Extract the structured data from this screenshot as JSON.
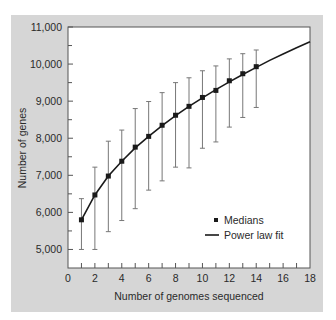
{
  "chart_data": {
    "type": "scatter",
    "title": "",
    "xlabel": "Number of genomes sequenced",
    "ylabel": "Number of genes",
    "xlim": [
      0,
      18
    ],
    "ylim": [
      4500,
      11000
    ],
    "xticks": [
      0,
      2,
      4,
      6,
      8,
      10,
      12,
      14,
      16,
      18
    ],
    "yticks": [
      5000,
      6000,
      7000,
      8000,
      9000,
      10000,
      11000
    ],
    "ytick_labels": [
      "5,000",
      "6,000",
      "7,000",
      "8,000",
      "9,000",
      "10,000",
      "11,000"
    ],
    "grid": false,
    "legend_position": "lower right",
    "series": [
      {
        "name": "Medians",
        "style": "square markers with error bars",
        "x": [
          1,
          2,
          3,
          4,
          5,
          6,
          7,
          8,
          9,
          10,
          11,
          12,
          13,
          14
        ],
        "values": [
          5800,
          6470,
          6980,
          7380,
          7760,
          8050,
          8350,
          8620,
          8860,
          9100,
          9290,
          9550,
          9740,
          9930
        ],
        "error_high": [
          6370,
          7220,
          7920,
          8220,
          8800,
          8990,
          9230,
          9500,
          9630,
          9820,
          9950,
          10140,
          10280,
          10380
        ],
        "error_low": [
          5000,
          5000,
          5480,
          5780,
          6100,
          6600,
          6850,
          7220,
          7200,
          7730,
          7900,
          8300,
          8560,
          8830
        ]
      },
      {
        "name": "Power law fit",
        "style": "solid line",
        "x": [
          1,
          2,
          3,
          4,
          5,
          6,
          7,
          8,
          9,
          10,
          11,
          12,
          13,
          14,
          15,
          16,
          17,
          18
        ],
        "values": [
          5800,
          6470,
          6980,
          7380,
          7740,
          8050,
          8340,
          8610,
          8860,
          9090,
          9310,
          9520,
          9720,
          9910,
          10100,
          10270,
          10440,
          10600
        ]
      }
    ],
    "legend": [
      "Medians",
      "Power law fit"
    ]
  }
}
